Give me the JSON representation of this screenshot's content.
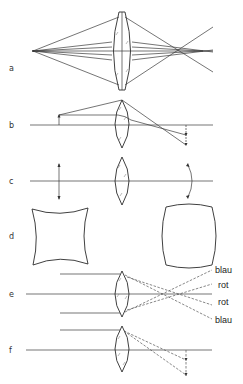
{
  "figure": {
    "type": "optical-lens-aberrations",
    "panels": [
      {
        "label": "a",
        "description": "spherical-aberration"
      },
      {
        "label": "b",
        "description": "coma"
      },
      {
        "label": "c",
        "description": "field-curvature"
      },
      {
        "label": "d",
        "description": "distortion"
      },
      {
        "label": "e",
        "description": "chromatic-aberration"
      },
      {
        "label": "f",
        "description": "lateral-chromatic-aberration"
      }
    ],
    "color_labels": {
      "blue_top": "blau",
      "red_top": "rot",
      "red_bottom": "rot",
      "blue_bottom": "blau"
    }
  }
}
